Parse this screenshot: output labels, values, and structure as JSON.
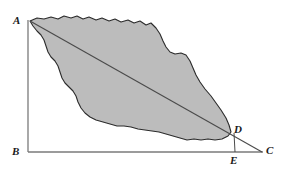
{
  "figure": {
    "canvas": {
      "width": 281,
      "height": 178,
      "background": "#ffffff"
    },
    "colors": {
      "region_fill": "#bcbcbc",
      "region_stroke": "#2b2b2b",
      "axis_stroke": "#7a7a7a",
      "diagonal_stroke": "#4a4a4a",
      "label_color": "#1a1a1a"
    },
    "labels": [
      {
        "id": "A",
        "text": "A",
        "x": 14,
        "y": 16,
        "point_x": 30,
        "point_y": 21
      },
      {
        "id": "B",
        "text": "B",
        "x": 13,
        "y": 147,
        "point_x": 28,
        "point_y": 152
      },
      {
        "id": "C",
        "text": "C",
        "x": 266,
        "y": 147,
        "point_x": 262,
        "point_y": 152
      },
      {
        "id": "D",
        "text": "D",
        "x": 233,
        "y": 126,
        "point_x": 230,
        "point_y": 133
      },
      {
        "id": "E",
        "text": "E",
        "x": 231,
        "y": 156,
        "point_x": 235,
        "point_y": 152
      }
    ],
    "segments": [
      {
        "id": "AB",
        "name": "vertical-axis",
        "x1": 28,
        "y1": 20,
        "x2": 28,
        "y2": 152
      },
      {
        "id": "BC",
        "name": "horizontal-axis",
        "x1": 28,
        "y1": 152,
        "x2": 262,
        "y2": 152
      },
      {
        "id": "AC",
        "name": "diagonal-line",
        "x1": 30,
        "y1": 21,
        "x2": 262,
        "y2": 152
      },
      {
        "id": "DE",
        "name": "perpendicular-drop",
        "x1": 233,
        "y1": 133,
        "x2": 235,
        "y2": 152
      }
    ],
    "region": {
      "name": "shaded-irregular-region",
      "path": "M 30 21 L 37 18 L 44 19 L 51 17 L 58 19 L 64 16 L 71 18 L 77 16 L 83 19 L 89 17 L 96 20 L 102 18 L 109 21 L 115 19 L 121 22 L 128 20 L 134 23 L 140 21 L 146 25 L 151 23 L 156 28 L 160 34 L 163 41 L 166 47 L 170 52 L 175 54 L 181 53 L 186 55 L 190 61 L 193 68 L 196 75 L 200 82 L 205 89 L 211 96 L 216 103 L 221 110 L 226 118 L 229 125 L 231 132 L 228 136 L 222 139 L 215 140 L 208 139 L 201 140 L 194 139 L 187 140 L 180 138 L 173 136 L 166 134 L 159 132 L 152 131 L 145 130 L 138 129 L 131 127 L 124 126 L 117 126 L 110 124 L 103 122 L 96 120 L 90 117 L 85 113 L 81 108 L 78 102 L 76 96 L 73 91 L 69 87 L 65 83 L 62 78 L 60 72 L 58 66 L 55 61 L 51 57 L 48 52 L 46 46 L 44 40 L 41 35 L 37 31 L 33 26 Z"
    }
  }
}
